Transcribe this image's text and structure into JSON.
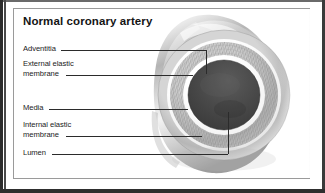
{
  "figure": {
    "title": "Normal coronary artery",
    "style": "grayscale anatomical illustration",
    "frame_border_color": "#9a9a9a",
    "page_border_color": "#2c2c2c"
  },
  "labels": [
    {
      "id": "adventitia",
      "text": "Adventitia",
      "text2": ""
    },
    {
      "id": "external-elastic-membrane",
      "text": "External elastic",
      "text2": "membrane"
    },
    {
      "id": "media",
      "text": "Media",
      "text2": ""
    },
    {
      "id": "internal-elastic-membrane",
      "text": "Internal elastic",
      "text2": "membrane"
    },
    {
      "id": "lumen",
      "text": "Lumen",
      "text2": ""
    }
  ],
  "anatomy_layers": [
    {
      "name": "Adventitia",
      "color": "#a8a8a8",
      "note": "outermost connective tissue coat"
    },
    {
      "name": "External elastic membrane",
      "color": "#f2f2f2",
      "note": "pale band outside the media"
    },
    {
      "name": "Media",
      "color": "#c4c4c4",
      "note": "thick striated muscular layer"
    },
    {
      "name": "Internal elastic membrane",
      "color": "#fbfbfb",
      "note": "bright inner ring lining the media"
    },
    {
      "name": "Lumen",
      "color": "#3a3a3a",
      "note": "open central channel for blood flow"
    }
  ]
}
